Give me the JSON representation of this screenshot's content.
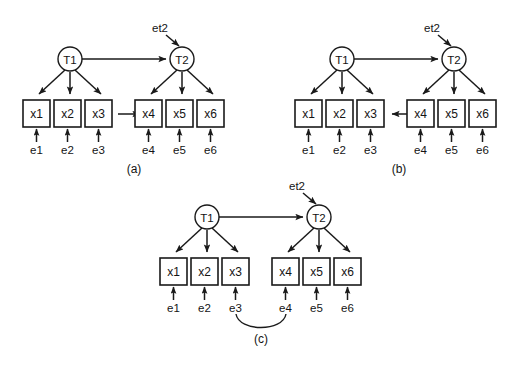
{
  "figure": {
    "background_color": "#ffffff",
    "stroke_color": "#1a1a1a",
    "text_color": "#141414",
    "type": "path-diagram"
  },
  "panels": [
    {
      "id": "a",
      "caption": "(a)",
      "latent": [
        {
          "id": "T1",
          "label": "T1"
        },
        {
          "id": "T2",
          "label": "T2"
        }
      ],
      "disturbance": {
        "id": "et2",
        "label": "et2",
        "target": "T2"
      },
      "indicators": [
        {
          "id": "x1",
          "label": "x1",
          "error": "e1"
        },
        {
          "id": "x2",
          "label": "x2",
          "error": "e2"
        },
        {
          "id": "x3",
          "label": "x3",
          "error": "e3"
        },
        {
          "id": "x4",
          "label": "x4",
          "error": "e4"
        },
        {
          "id": "x5",
          "label": "x5",
          "error": "e5"
        },
        {
          "id": "x6",
          "label": "x6",
          "error": "e6"
        }
      ],
      "errors": [
        {
          "id": "e1",
          "label": "e1"
        },
        {
          "id": "e2",
          "label": "e2"
        },
        {
          "id": "e3",
          "label": "e3"
        },
        {
          "id": "e4",
          "label": "e4"
        },
        {
          "id": "e5",
          "label": "e5"
        },
        {
          "id": "e6",
          "label": "e6"
        }
      ],
      "extra_path": {
        "from": "x3",
        "to": "x4",
        "kind": "directed"
      }
    },
    {
      "id": "b",
      "caption": "(b)",
      "latent": [
        {
          "id": "T1",
          "label": "T1"
        },
        {
          "id": "T2",
          "label": "T2"
        }
      ],
      "disturbance": {
        "id": "et2",
        "label": "et2",
        "target": "T2"
      },
      "indicators": [
        {
          "id": "x1",
          "label": "x1",
          "error": "e1"
        },
        {
          "id": "x2",
          "label": "x2",
          "error": "e2"
        },
        {
          "id": "x3",
          "label": "x3",
          "error": "e3"
        },
        {
          "id": "x4",
          "label": "x4",
          "error": "e4"
        },
        {
          "id": "x5",
          "label": "x5",
          "error": "e5"
        },
        {
          "id": "x6",
          "label": "x6",
          "error": "e6"
        }
      ],
      "errors": [
        {
          "id": "e1",
          "label": "e1"
        },
        {
          "id": "e2",
          "label": "e2"
        },
        {
          "id": "e3",
          "label": "e3"
        },
        {
          "id": "e4",
          "label": "e4"
        },
        {
          "id": "e5",
          "label": "e5"
        },
        {
          "id": "e6",
          "label": "e6"
        }
      ],
      "extra_path": {
        "from": "x4",
        "to": "x3",
        "kind": "directed"
      }
    },
    {
      "id": "c",
      "caption": "(c)",
      "latent": [
        {
          "id": "T1",
          "label": "T1"
        },
        {
          "id": "T2",
          "label": "T2"
        }
      ],
      "disturbance": {
        "id": "et2",
        "label": "et2",
        "target": "T2"
      },
      "indicators": [
        {
          "id": "x1",
          "label": "x1",
          "error": "e1"
        },
        {
          "id": "x2",
          "label": "x2",
          "error": "e2"
        },
        {
          "id": "x3",
          "label": "x3",
          "error": "e3"
        },
        {
          "id": "x4",
          "label": "x4",
          "error": "e4"
        },
        {
          "id": "x5",
          "label": "x5",
          "error": "e5"
        },
        {
          "id": "x6",
          "label": "x6",
          "error": "e6"
        }
      ],
      "errors": [
        {
          "id": "e1",
          "label": "e1"
        },
        {
          "id": "e2",
          "label": "e2"
        },
        {
          "id": "e3",
          "label": "e3"
        },
        {
          "id": "e4",
          "label": "e4"
        },
        {
          "id": "e5",
          "label": "e5"
        },
        {
          "id": "e6",
          "label": "e6"
        }
      ],
      "extra_path": {
        "from": "e3",
        "to": "e4",
        "kind": "correlation-curve"
      }
    }
  ]
}
